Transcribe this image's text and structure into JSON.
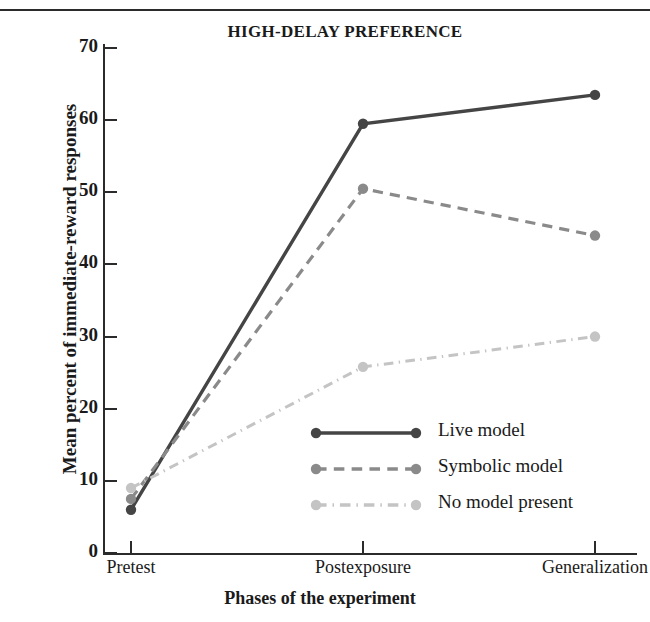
{
  "figure": {
    "top_rule": true
  },
  "chart_data": {
    "type": "line",
    "title": "HIGH-DELAY PREFERENCE",
    "xlabel": "Phases of the experiment",
    "ylabel": "Mean percent of immediate-reward responses",
    "categories": [
      "Pretest",
      "Postexposure",
      "Generalization"
    ],
    "ylim": [
      0,
      70
    ],
    "yticks": [
      0,
      10,
      20,
      30,
      40,
      50,
      60,
      70
    ],
    "ytick_labels": [
      "0",
      "10",
      "20",
      "30",
      "40",
      "50",
      "60",
      "70"
    ],
    "grid": false,
    "legend_position": "inside-lower-right",
    "series": [
      {
        "name": "Live model",
        "values": [
          6,
          59.5,
          63.5
        ],
        "color": "#454545",
        "line_style": "solid",
        "marker": "circle"
      },
      {
        "name": "Symbolic model",
        "values": [
          7.5,
          50.5,
          44
        ],
        "color": "#8a8a8a",
        "line_style": "dashed",
        "marker": "circle"
      },
      {
        "name": "No model present",
        "values": [
          9,
          25.8,
          30
        ],
        "color": "#c4c4c4",
        "line_style": "dash-dot",
        "marker": "circle"
      }
    ]
  }
}
